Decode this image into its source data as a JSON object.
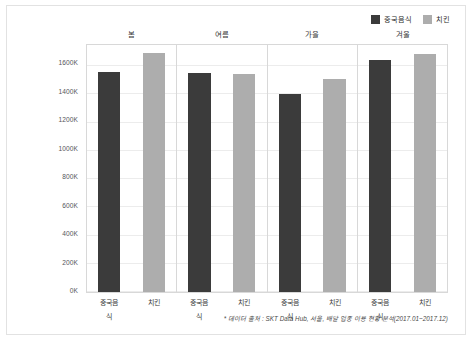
{
  "legend": {
    "entries": [
      {
        "label": "중국음식",
        "color": "#3b3b3b",
        "icon": "legend-swatch-icon"
      },
      {
        "label": "치킨",
        "color": "#adadad",
        "icon": "legend-swatch-icon"
      }
    ]
  },
  "footnote": "* 데이터 출처 : SKT Data Hub, 서울, 배달 업종 이용 현황 분석(2017.01~2017.12)",
  "chart_data": {
    "type": "bar",
    "title": "",
    "subtitle": "",
    "xlabel": "",
    "ylabel": "",
    "categories": [
      "봄",
      "여름",
      "가을",
      "겨울"
    ],
    "subcategories": [
      "중국음식",
      "치킨"
    ],
    "series": [
      {
        "name": "중국음식",
        "color": "#3b3b3b",
        "values": [
          1560000,
          1555000,
          1405000,
          1645000
        ]
      },
      {
        "name": "치킨",
        "color": "#adadad",
        "values": [
          1690000,
          1545000,
          1510000,
          1685000
        ]
      }
    ],
    "ylim": [
      0,
      1750000
    ],
    "yticks": [
      0,
      200000,
      400000,
      600000,
      800000,
      1000000,
      1200000,
      1400000,
      1600000
    ],
    "ytick_labels": [
      "0K",
      "200K",
      "400K",
      "600K",
      "800K",
      "1000K",
      "1200K",
      "1400K",
      "1600K"
    ],
    "grid": true,
    "legend_position": "top-right",
    "faceted": true,
    "facet_labels": [
      "봄",
      "여름",
      "가을",
      "겨울"
    ]
  }
}
